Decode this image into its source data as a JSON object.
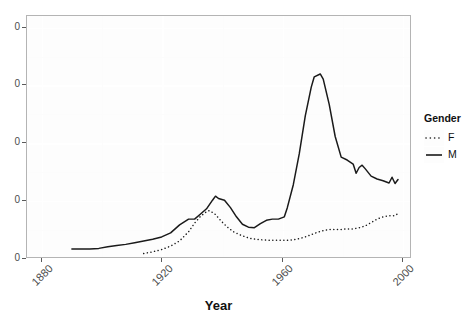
{
  "chart_data": {
    "type": "line",
    "title": "",
    "xlabel": "Year",
    "ylabel": "",
    "xlim": [
      1875,
      2003
    ],
    "ylim": [
      0,
      42
    ],
    "xticks": [
      "1880",
      "1920",
      "1960",
      "2000"
    ],
    "xtick_values": [
      1880,
      1920,
      1960,
      2000
    ],
    "yticks": [
      "0",
      "0",
      "0",
      "0",
      "0"
    ],
    "ytick_values": [
      0,
      10,
      20,
      30,
      40
    ],
    "ytick_labels_note": "y-axis tick labels are clipped by the left image edge; only the trailing 0 of each label is visible",
    "grid": true,
    "legend": {
      "title": "Gender",
      "position": "right",
      "entries": [
        {
          "name": "F",
          "style": "dotted"
        },
        {
          "name": "M",
          "style": "solid"
        }
      ]
    },
    "series": [
      {
        "name": "M",
        "style": "solid",
        "color": "#1a1a1a",
        "points": [
          [
            1890,
            1.4
          ],
          [
            1893,
            1.4
          ],
          [
            1896,
            1.4
          ],
          [
            1899,
            1.5
          ],
          [
            1902,
            1.8
          ],
          [
            1905,
            2.0
          ],
          [
            1908,
            2.2
          ],
          [
            1911,
            2.5
          ],
          [
            1914,
            2.8
          ],
          [
            1917,
            3.1
          ],
          [
            1920,
            3.5
          ],
          [
            1923,
            4.2
          ],
          [
            1926,
            5.6
          ],
          [
            1929,
            6.6
          ],
          [
            1931,
            6.6
          ],
          [
            1933,
            7.5
          ],
          [
            1935,
            8.4
          ],
          [
            1937,
            9.9
          ],
          [
            1938,
            10.6
          ],
          [
            1939,
            10.2
          ],
          [
            1941,
            9.9
          ],
          [
            1943,
            8.6
          ],
          [
            1945,
            7.0
          ],
          [
            1947,
            5.7
          ],
          [
            1949,
            5.2
          ],
          [
            1951,
            5.1
          ],
          [
            1953,
            5.8
          ],
          [
            1955,
            6.4
          ],
          [
            1957,
            6.6
          ],
          [
            1959,
            6.6
          ],
          [
            1961,
            7.0
          ],
          [
            1962,
            8.6
          ],
          [
            1964,
            12.6
          ],
          [
            1966,
            18.0
          ],
          [
            1968,
            24.6
          ],
          [
            1970,
            29.6
          ],
          [
            1971,
            31.4
          ],
          [
            1973,
            31.9
          ],
          [
            1974,
            31.0
          ],
          [
            1976,
            26.6
          ],
          [
            1978,
            21.0
          ],
          [
            1980,
            17.4
          ],
          [
            1982,
            16.9
          ],
          [
            1984,
            16.2
          ],
          [
            1985,
            14.6
          ],
          [
            1986,
            15.6
          ],
          [
            1987,
            16.0
          ],
          [
            1988,
            15.4
          ],
          [
            1990,
            14.1
          ],
          [
            1992,
            13.6
          ],
          [
            1994,
            13.3
          ],
          [
            1996,
            12.9
          ],
          [
            1997,
            13.9
          ],
          [
            1998,
            12.8
          ],
          [
            1999,
            13.5
          ]
        ]
      },
      {
        "name": "F",
        "style": "dotted",
        "color": "#1a1a1a",
        "points": [
          [
            1914,
            0.6
          ],
          [
            1917,
            0.9
          ],
          [
            1920,
            1.3
          ],
          [
            1923,
            1.9
          ],
          [
            1926,
            2.8
          ],
          [
            1929,
            4.4
          ],
          [
            1931,
            5.9
          ],
          [
            1933,
            7.1
          ],
          [
            1935,
            7.9
          ],
          [
            1936,
            8.1
          ],
          [
            1938,
            7.4
          ],
          [
            1940,
            6.2
          ],
          [
            1942,
            5.2
          ],
          [
            1944,
            4.4
          ],
          [
            1946,
            3.9
          ],
          [
            1948,
            3.5
          ],
          [
            1950,
            3.2
          ],
          [
            1953,
            3.0
          ],
          [
            1956,
            2.9
          ],
          [
            1959,
            2.9
          ],
          [
            1962,
            2.9
          ],
          [
            1964,
            3.0
          ],
          [
            1966,
            3.2
          ],
          [
            1968,
            3.5
          ],
          [
            1970,
            3.9
          ],
          [
            1972,
            4.3
          ],
          [
            1974,
            4.6
          ],
          [
            1976,
            4.8
          ],
          [
            1978,
            4.8
          ],
          [
            1980,
            4.8
          ],
          [
            1982,
            4.9
          ],
          [
            1984,
            4.9
          ],
          [
            1986,
            5.1
          ],
          [
            1988,
            5.4
          ],
          [
            1990,
            6.0
          ],
          [
            1992,
            6.6
          ],
          [
            1994,
            7.0
          ],
          [
            1996,
            7.2
          ],
          [
            1998,
            7.2
          ],
          [
            1999,
            7.6
          ]
        ]
      }
    ]
  },
  "axis": {
    "x_title": "Year"
  },
  "legend": {
    "title": "Gender",
    "item_f": "F",
    "item_m": "M"
  }
}
